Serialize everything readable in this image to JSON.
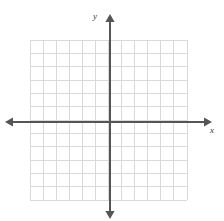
{
  "figure": {
    "kind": "coordinate-grid",
    "title": "",
    "background_color": "#ffffff"
  },
  "axes": {
    "x_axis": {
      "label": "x",
      "label_icon": "x-axis-label",
      "color": "#555555",
      "arrow_left": true,
      "arrow_right": true,
      "start_px": 5,
      "end_px": 212,
      "y_px": 122
    },
    "y_axis": {
      "label": "y",
      "label_icon": "y-axis-label",
      "color": "#555555",
      "arrow_up": true,
      "arrow_down": true,
      "start_px": 14,
      "end_px": 219,
      "x_px": 110
    },
    "origin": {
      "x_px": 110,
      "y_px": 122
    }
  },
  "grid": {
    "color": "#d9d9d9",
    "border_color": "#d9d9d9",
    "columns": 12,
    "rows": 12,
    "cell_width_px": 13.08,
    "cell_height_px": 13.33,
    "left_px": 30,
    "top_px": 40,
    "right_px": 187,
    "bottom_px": 200,
    "x_range": [
      -6,
      6
    ],
    "y_range": [
      -6,
      6
    ],
    "tick_labels_visible": false
  },
  "chart_data": {
    "type": "scatter",
    "title": "",
    "xlabel": "x",
    "ylabel": "y",
    "xlim": [
      -6,
      6
    ],
    "ylim": [
      -6,
      6
    ],
    "x": [],
    "y": [],
    "series": [],
    "grid": true,
    "legend": false,
    "xticks": [
      -6,
      -5,
      -4,
      -3,
      -2,
      -1,
      0,
      1,
      2,
      3,
      4,
      5,
      6
    ],
    "yticks": [
      -6,
      -5,
      -4,
      -3,
      -2,
      -1,
      0,
      1,
      2,
      3,
      4,
      5,
      6
    ],
    "xticklabels": [],
    "yticklabels": [],
    "annotations": []
  }
}
